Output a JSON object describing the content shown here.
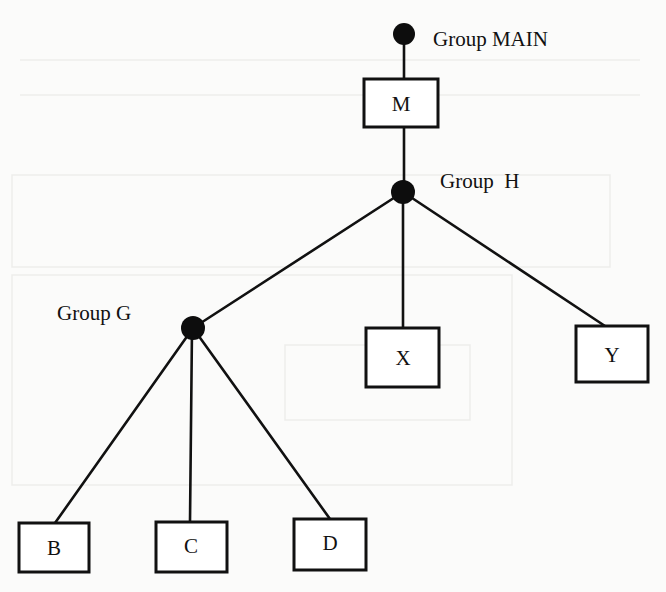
{
  "diagram": {
    "type": "tree",
    "groups": {
      "main": {
        "label": "Group MAIN"
      },
      "h": {
        "label": "Group  H"
      },
      "g": {
        "label": "Group G"
      }
    },
    "nodes": {
      "m": {
        "label": "M"
      },
      "x": {
        "label": "X"
      },
      "y": {
        "label": "Y"
      },
      "b": {
        "label": "B"
      },
      "c": {
        "label": "C"
      },
      "d": {
        "label": "D"
      }
    },
    "edges": [
      {
        "from": "Group MAIN",
        "to": "M"
      },
      {
        "from": "M",
        "to": "Group H"
      },
      {
        "from": "Group H",
        "to": "Group G"
      },
      {
        "from": "Group H",
        "to": "X"
      },
      {
        "from": "Group H",
        "to": "Y"
      },
      {
        "from": "Group G",
        "to": "B"
      },
      {
        "from": "Group G",
        "to": "C"
      },
      {
        "from": "Group G",
        "to": "D"
      }
    ],
    "colors": {
      "ink": "#111111",
      "paper": "#fbfbfa"
    }
  }
}
